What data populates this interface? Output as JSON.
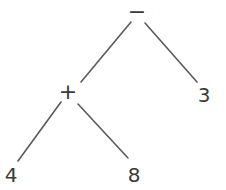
{
  "figure": {
    "kind": "binary-expression-tree",
    "expression": "(4 + 8) - 3",
    "background_color": "#ffffff",
    "edge_color": "#5a5a5a",
    "text_color": "#3a3a3a",
    "width": 226,
    "height": 190
  },
  "nodes": [
    {
      "id": "root",
      "label": "−",
      "role": "operator",
      "x": 137,
      "y": 12,
      "name": "node-minus"
    },
    {
      "id": "plus",
      "label": "+",
      "role": "operator",
      "x": 68,
      "y": 92,
      "name": "node-plus"
    },
    {
      "id": "three",
      "label": "3",
      "role": "leaf",
      "x": 204,
      "y": 95,
      "name": "node-3"
    },
    {
      "id": "four",
      "label": "4",
      "role": "leaf",
      "x": 11,
      "y": 175,
      "name": "node-4"
    },
    {
      "id": "eight",
      "label": "8",
      "role": "leaf",
      "x": 134,
      "y": 175,
      "name": "node-8"
    }
  ],
  "edges": [
    {
      "id": "minus-plus",
      "from": "root",
      "to": "plus",
      "x1": 131,
      "y1": 22,
      "x2": 81,
      "y2": 82,
      "name": "edge-minus-to-plus"
    },
    {
      "id": "minus-three",
      "from": "root",
      "to": "three",
      "x1": 145,
      "y1": 23,
      "x2": 197,
      "y2": 82,
      "name": "edge-minus-to-3"
    },
    {
      "id": "plus-four",
      "from": "plus",
      "to": "four",
      "x1": 61,
      "y1": 102,
      "x2": 18,
      "y2": 161,
      "name": "edge-plus-to-4"
    },
    {
      "id": "plus-eight",
      "from": "plus",
      "to": "eight",
      "x1": 78,
      "y1": 104,
      "x2": 128,
      "y2": 158,
      "name": "edge-plus-to-8"
    }
  ]
}
